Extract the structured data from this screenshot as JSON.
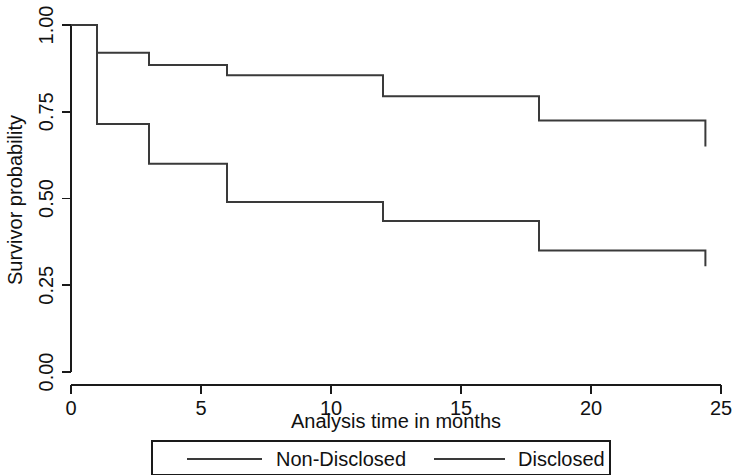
{
  "chart_data": {
    "type": "line",
    "subtype": "kaplan-meier-step",
    "title": "",
    "xlabel": "Analysis time in months",
    "ylabel": "Survivor probability",
    "xlim": [
      0,
      25
    ],
    "ylim": [
      0.0,
      1.0
    ],
    "xticks": [
      0,
      5,
      10,
      15,
      20,
      25
    ],
    "xtick_labels": [
      "0",
      "5",
      "10",
      "15",
      "20",
      "25"
    ],
    "yticks": [
      0.0,
      0.25,
      0.5,
      0.75,
      1.0
    ],
    "ytick_labels": [
      "0.00",
      "0.25",
      "0.50",
      "0.75",
      "1.00"
    ],
    "grid": false,
    "legend_position": "bottom",
    "series": [
      {
        "name": "Non-Disclosed",
        "color": "#3a3a3a",
        "step_times": [
          0,
          1,
          3,
          6,
          12,
          18,
          24,
          24.4
        ],
        "step_values": [
          1.0,
          0.92,
          0.885,
          0.855,
          0.795,
          0.725,
          0.725,
          0.65
        ]
      },
      {
        "name": "Disclosed",
        "color": "#3a3a3a",
        "step_times": [
          0,
          1,
          3,
          6,
          12,
          18,
          24,
          24.4
        ],
        "step_values": [
          1.0,
          0.715,
          0.6,
          0.49,
          0.435,
          0.35,
          0.35,
          0.305
        ]
      }
    ]
  },
  "legend": {
    "entries": [
      {
        "label": "Non-Disclosed"
      },
      {
        "label": "Disclosed"
      }
    ]
  },
  "axes": {
    "x_title": "Analysis time in months",
    "y_title": "Survivor probability"
  }
}
